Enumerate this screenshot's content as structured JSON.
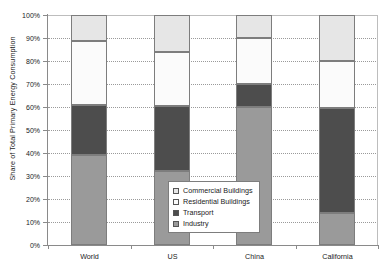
{
  "chart_data": {
    "type": "bar",
    "subtype": "stacked-100-percent",
    "title": "",
    "xlabel": "",
    "ylabel": "Share of Total Primary Energy Consumption",
    "categories": [
      "World",
      "US",
      "China",
      "California"
    ],
    "ylim": [
      0,
      100
    ],
    "ytick_labels": [
      "0%",
      "10%",
      "20%",
      "30%",
      "40%",
      "50%",
      "60%",
      "70%",
      "80%",
      "90%",
      "100%"
    ],
    "ytick_values": [
      0,
      10,
      20,
      30,
      40,
      50,
      60,
      70,
      80,
      90,
      100
    ],
    "grid": "horizontal-dotted",
    "legend_position": "inside-center-lower",
    "stack_order_bottom_to_top": [
      "Industry",
      "Transport",
      "Residential Buildings",
      "Commercial Buildings"
    ],
    "series": [
      {
        "name": "Industry",
        "color": "#9a9a9a",
        "values": [
          39,
          32,
          60,
          14
        ]
      },
      {
        "name": "Transport",
        "color": "#4d4d4d",
        "values": [
          22,
          28.5,
          10,
          45.5
        ]
      },
      {
        "name": "Residential Buildings",
        "color": "#fbfbfb",
        "values": [
          27.5,
          23.5,
          20,
          20.5
        ]
      },
      {
        "name": "Commercial Buildings",
        "color": "#e6e6e6",
        "values": [
          11.5,
          16,
          10,
          20
        ]
      }
    ],
    "cumulative_tops": {
      "Industry": [
        39,
        32,
        60,
        14
      ],
      "Transport": [
        61,
        60.5,
        70,
        59.5
      ],
      "Residential Buildings": [
        88.5,
        84,
        90,
        80
      ],
      "Commercial Buildings": [
        100,
        100,
        100,
        100
      ]
    }
  },
  "legend": {
    "items": [
      {
        "label": "Commercial Buildings",
        "color": "#e6e6e6"
      },
      {
        "label": "Residential Buildings",
        "color": "#fbfbfb"
      },
      {
        "label": "Transport",
        "color": "#4d4d4d"
      },
      {
        "label": "Industry",
        "color": "#9a9a9a"
      }
    ]
  }
}
